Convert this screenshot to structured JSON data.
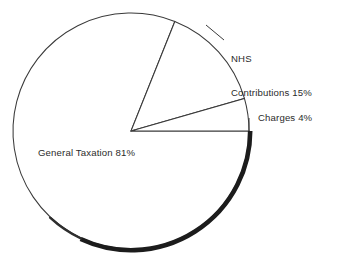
{
  "chart_data": {
    "type": "pie",
    "title": "",
    "subtitle": "",
    "xlabel": "",
    "ylabel": "",
    "unit": "%",
    "grid": false,
    "legend": "none",
    "label_style": "callout-labels-outside",
    "start_angle_deg": 21.8,
    "direction": "clockwise",
    "categories": [
      "NHS Contributions",
      "Charges",
      "General Taxation"
    ],
    "values": [
      15,
      4,
      81
    ],
    "slices": [
      {
        "name": "NHS Contributions",
        "value": 15,
        "label": "NHS\nContributions 15%",
        "label_line_1": "NHS",
        "label_line_2": "Contributions 15%",
        "start_angle_deg": 21.8,
        "end_angle_deg": 74.0,
        "fill": "#ffffff",
        "stroke": "#3a3a3a"
      },
      {
        "name": "Charges",
        "value": 4,
        "label": "Charges 4%",
        "start_angle_deg": 74.0,
        "end_angle_deg": 90.0,
        "fill": "#ffffff",
        "stroke": "#3a3a3a"
      },
      {
        "name": "General Taxation",
        "value": 81,
        "label": "General Taxation 81%",
        "start_angle_deg": 90.0,
        "end_angle_deg": 381.8,
        "fill": "#ffffff",
        "stroke": "#3a3a3a"
      }
    ],
    "geometry": {
      "center_x": 131,
      "center_y": 131,
      "radius": 118,
      "shadow_arc_start_deg": 90,
      "shadow_arc_end_deg": 205
    },
    "colors": {
      "background": "#ffffff",
      "outline": "#3a3a3a",
      "shadow": "#1c1c1c",
      "text": "#2b2b2b"
    }
  },
  "labels": {
    "nhs_line_1": "NHS",
    "nhs_line_2": "Contributions 15%",
    "charges": "Charges 4%",
    "general_taxation": "General Taxation 81%"
  }
}
